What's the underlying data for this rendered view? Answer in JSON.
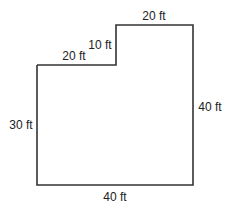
{
  "diagram": {
    "type": "floor-plan-outline",
    "shape": "L-shaped polygon",
    "stroke_color": "#333333",
    "labels": {
      "top": "20 ft",
      "step_vertical": "10 ft",
      "step_horizontal": "20 ft",
      "left": "30 ft",
      "right": "40 ft",
      "bottom": "40 ft"
    }
  }
}
